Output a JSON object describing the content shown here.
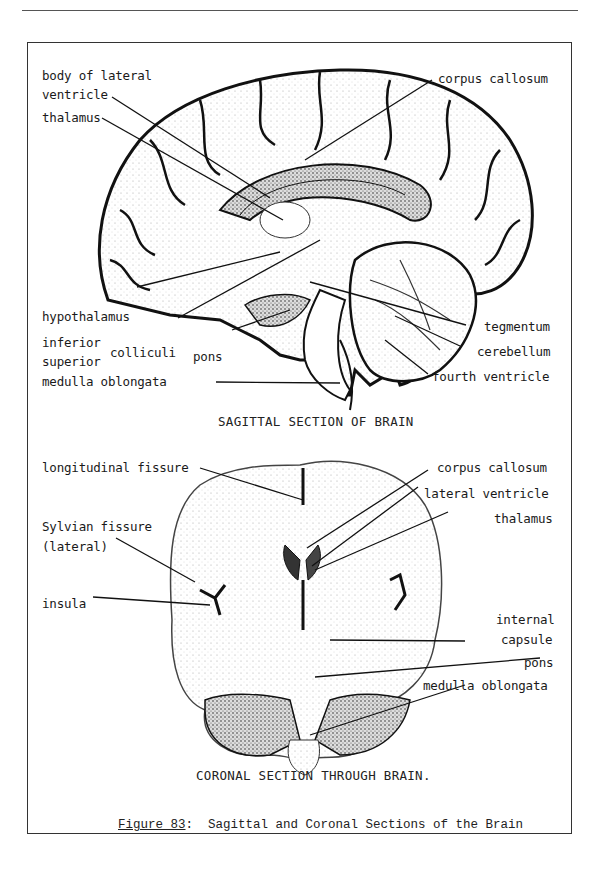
{
  "sagittal": {
    "title": "SAGITTAL SECTION OF BRAIN",
    "labels": {
      "body_of_lateral_1": "body of lateral",
      "body_of_lateral_2": "ventricle",
      "thalamus": "thalamus",
      "corpus_callosum": "corpus callosum",
      "hypothalamus": "hypothalamus",
      "inferior": "inferior",
      "superior": "superior",
      "colliculi": "colliculi",
      "pons": "pons",
      "medulla_oblongata": "medulla oblongata",
      "tegmentum": "tegmentum",
      "cerebellum": "cerebellum",
      "fourth_ventricle": "fourth ventricle"
    }
  },
  "coronal": {
    "title": "CORONAL SECTION THROUGH BRAIN.",
    "labels": {
      "longitudinal_fissure": "longitudinal fissure",
      "sylvian_1": "Sylvian fissure",
      "sylvian_2": "(lateral)",
      "insula": "insula",
      "corpus_callosum": "corpus callosum",
      "lateral_ventricle": "lateral ventricle",
      "thalamus": "thalamus",
      "internal_1": "internal",
      "internal_2": "capsule",
      "pons": "pons",
      "medulla_oblongata": "medulla oblongata"
    }
  },
  "figure": {
    "number": "Figure 83",
    "separator": ":",
    "caption": "Sagittal and Coronal Sections of the Brain"
  }
}
